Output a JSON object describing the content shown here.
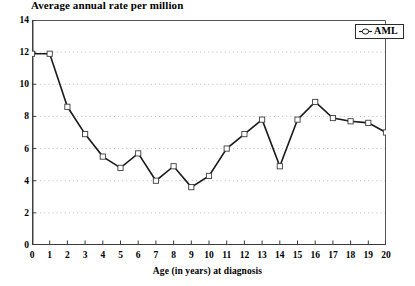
{
  "chart_data": {
    "type": "line",
    "title": "Average annual rate per million",
    "xlabel": "Age (in years) at diagnosis",
    "ylabel": "",
    "xlim": [
      0,
      20
    ],
    "ylim": [
      0,
      14
    ],
    "xticks": [
      "0",
      "1",
      "2",
      "3",
      "4",
      "5",
      "6",
      "7",
      "8",
      "9",
      "10",
      "11",
      "12",
      "13",
      "14",
      "15",
      "16",
      "17",
      "18",
      "19",
      "20"
    ],
    "yticks": [
      "0",
      "2",
      "4",
      "6",
      "8",
      "10",
      "12",
      "14"
    ],
    "grid": true,
    "grid_style": "dotted-horizontal",
    "legend_position": "top-right",
    "line_color": "#1a1a1a",
    "marker": "open-square",
    "series": [
      {
        "name": "AML",
        "x": [
          0,
          1,
          2,
          3,
          4,
          5,
          6,
          7,
          8,
          9,
          10,
          11,
          12,
          13,
          14,
          15,
          16,
          17,
          18,
          19,
          20
        ],
        "values": [
          11.9,
          11.9,
          8.6,
          6.9,
          5.5,
          4.8,
          5.7,
          4.0,
          4.9,
          3.6,
          4.3,
          6.0,
          6.9,
          7.8,
          4.9,
          7.8,
          8.9,
          7.9,
          7.7,
          7.6,
          7.0
        ]
      }
    ]
  },
  "legend": {
    "entries": [
      {
        "label": "AML",
        "marker_name": "aml-series-marker"
      }
    ]
  }
}
